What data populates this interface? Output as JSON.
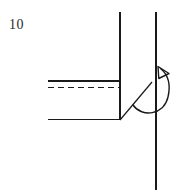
{
  "figure": {
    "label": "10",
    "background_color": "#ffffff",
    "stroke_color": "#1a1a1a",
    "width": 182,
    "height": 194,
    "elements": {
      "left_vertical_line": {
        "name": "left-vertical-line",
        "x1": 120,
        "y1": 12,
        "x2": 120,
        "y2": 120,
        "style": "solid"
      },
      "right_vertical_axis": {
        "name": "right-vertical-axis",
        "x1": 156,
        "y1": 12,
        "x2": 156,
        "y2": 190,
        "style": "solid"
      },
      "top_solid_horizontal_line": {
        "name": "top-solid-horizontal-line",
        "x1": 48,
        "y1": 81,
        "x2": 120,
        "y2": 81,
        "style": "solid"
      },
      "dashed_horizontal_line": {
        "name": "dashed-horizontal-line",
        "x1": 48,
        "y1": 87,
        "x2": 120,
        "y2": 87,
        "style": "dashed",
        "dash_pattern": "6 4"
      },
      "bottom_horizontal_line": {
        "name": "bottom-horizontal-line",
        "x1": 48,
        "y1": 119,
        "x2": 120,
        "y2": 119,
        "style": "solid"
      },
      "diagonal_line": {
        "name": "diagonal-line",
        "x1": 120,
        "y1": 120,
        "x2": 152,
        "y2": 82,
        "style": "solid"
      },
      "rotation_arrow": {
        "name": "rotation-arrow",
        "description": "curved arrow wrapping around the vertical axis, arrowhead pointing up-left",
        "path": "M 133 105 C 143 117, 165 113, 168 96 C 171 82, 166 73, 160 68",
        "arrowhead_points": "160,68 159,78 169,74"
      }
    }
  }
}
